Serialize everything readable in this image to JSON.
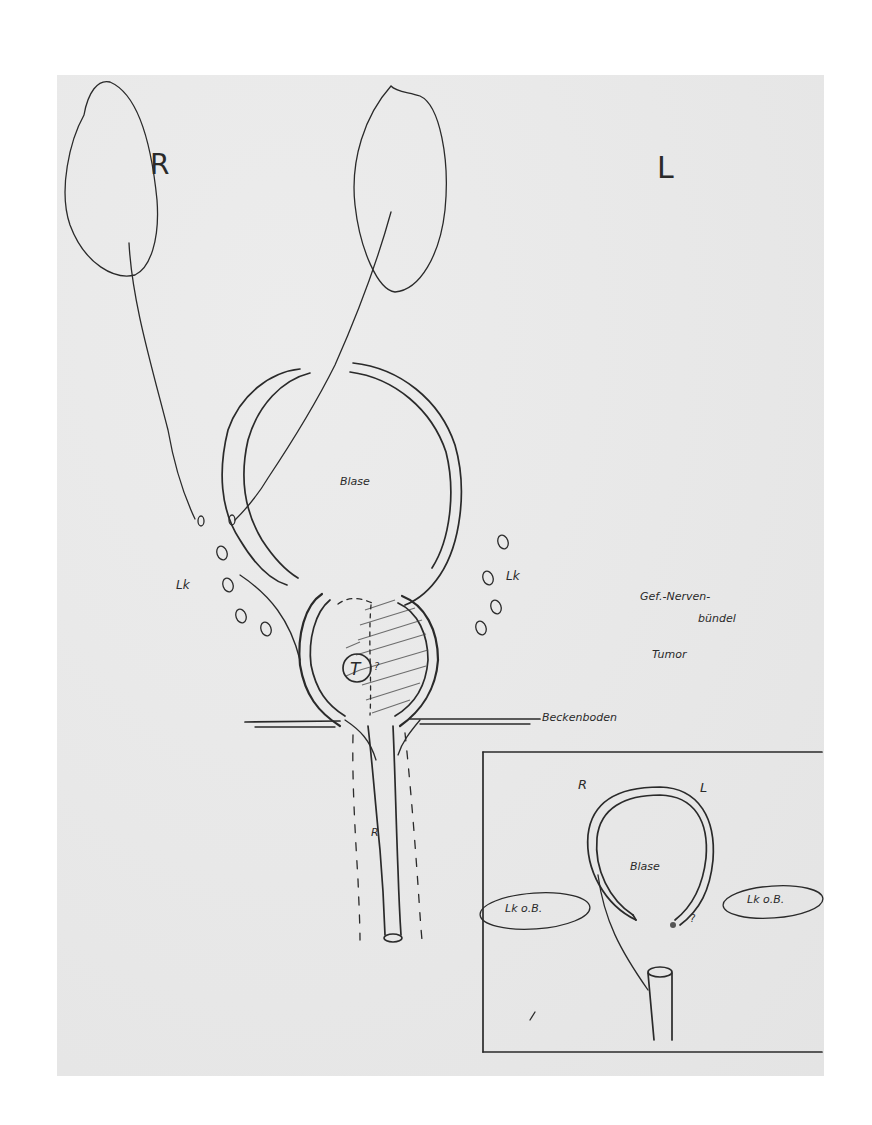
{
  "figure": {
    "type": "hand-drawn anatomical sketch",
    "background": "#ffffff",
    "paper_color": "#e6e6e6",
    "ink_color": "#2a2a2a"
  },
  "main_sketch": {
    "kidney_right_label": "R",
    "kidney_left_label": "L",
    "bladder_label": "Blase",
    "lymph_nodes_label_left": "Lk",
    "lymph_nodes_label_right": "Lk",
    "tumor_marker": "T",
    "neurovascular_bundle_label_line1": "Gef.-Nerven-",
    "neurovascular_bundle_label_line2": "bündel",
    "tumor_label": "Tumor",
    "pelvic_floor_label": "Beckenboden",
    "urethra_label": "R"
  },
  "inset_sketch": {
    "right_side_label": "R",
    "left_side_label": "L",
    "bladder_label": "Blase",
    "lymph_nodes_left_label": "Lk o.B.",
    "lymph_nodes_right_label": "Lk o.B.",
    "annotation_marker": "?"
  }
}
